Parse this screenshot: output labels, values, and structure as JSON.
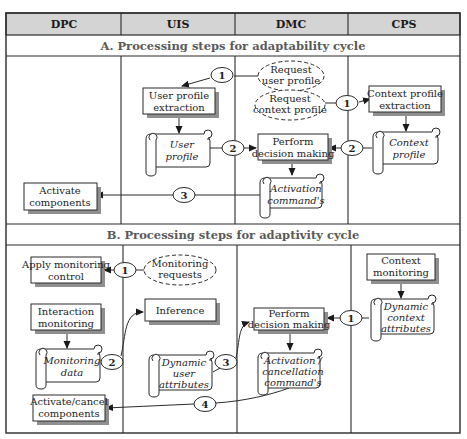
{
  "columns": [
    {
      "id": "dpc",
      "label": "DPC"
    },
    {
      "id": "uis",
      "label": "UIS"
    },
    {
      "id": "dmc",
      "label": "DMC"
    },
    {
      "id": "cps",
      "label": "CPS"
    }
  ],
  "sections": {
    "a": {
      "title": "A. Processing steps for adaptability cycle"
    },
    "b": {
      "title": "B. Processing steps for adaptivity cycle"
    }
  },
  "colors": {
    "header_bg": "#d4d4d4",
    "line": "#2a2a2a",
    "section_text": "#5a5a5a",
    "shadow": "#9a9a9a"
  },
  "section_a": {
    "request_user_profile": [
      "Request",
      "user profile"
    ],
    "request_context_profile": [
      "Request",
      "context profile"
    ],
    "user_profile_extraction": [
      "User profile",
      "extraction"
    ],
    "user_profile": [
      "User",
      "profile"
    ],
    "context_profile_extraction": [
      "Context profile",
      "extraction"
    ],
    "context_profile": [
      "Context",
      "profile"
    ],
    "perform_decision_making": [
      "Perform",
      "decision making"
    ],
    "activation_commands": [
      "Activation",
      "command's"
    ],
    "activate_components": [
      "Activate",
      "components"
    ],
    "steps": [
      "1",
      "1",
      "2",
      "2",
      "3"
    ]
  },
  "section_b": {
    "monitoring_requests": [
      "Monitoring",
      "requests"
    ],
    "apply_monitoring_control": [
      "Apply monitoring",
      "control"
    ],
    "interaction_monitoring": [
      "Interaction",
      "monitoring"
    ],
    "monitoring_data": [
      "Monitoring",
      "data"
    ],
    "inference": [
      "Inference"
    ],
    "dynamic_user_attributes": [
      "Dynamic",
      "user",
      "attributes"
    ],
    "context_monitoring": [
      "Context",
      "monitoring"
    ],
    "dynamic_context_attributes": [
      "Dynamic",
      "context",
      "attributes"
    ],
    "perform_decision_making": [
      "Perform",
      "decision making"
    ],
    "activation_cancellation_commands": [
      "Activation /",
      "cancellation",
      "command's"
    ],
    "activate_cancel_components": [
      "Activate/cancel",
      "components"
    ],
    "steps": [
      "1",
      "1",
      "2",
      "3",
      "4"
    ]
  }
}
